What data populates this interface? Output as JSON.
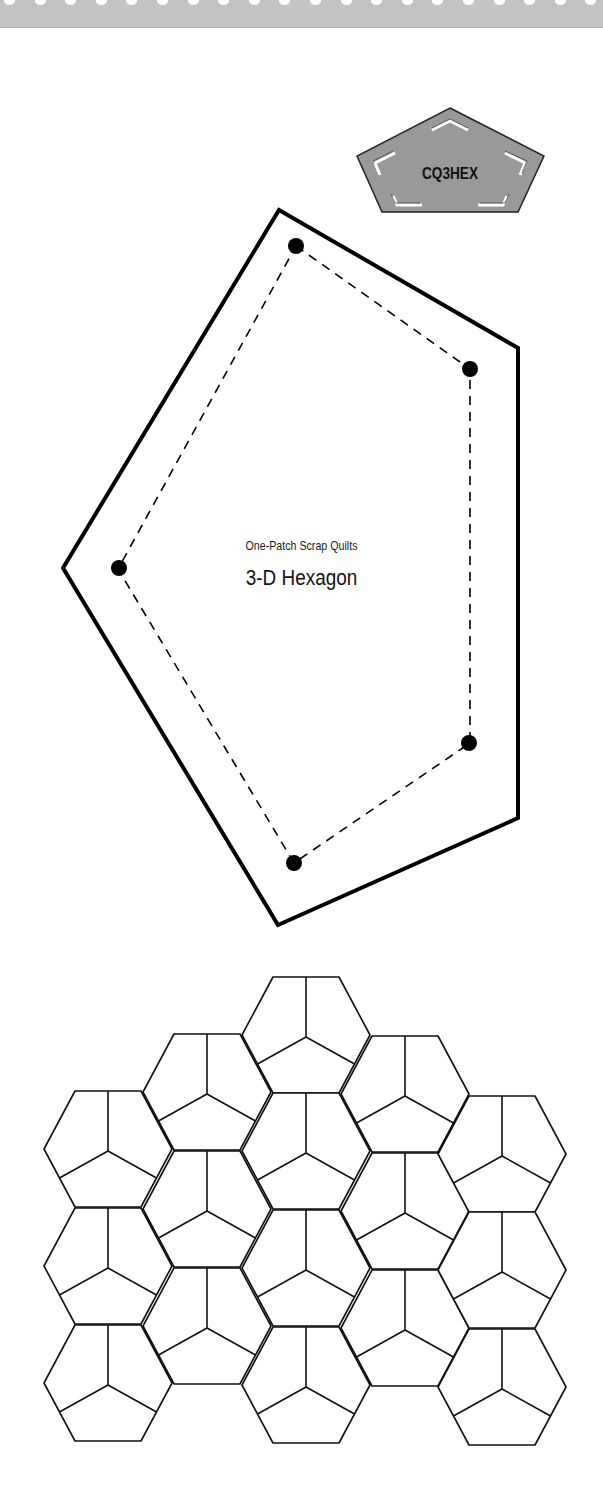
{
  "header": {
    "perforation_count": 20,
    "band_color": "#c4c4c4"
  },
  "badge": {
    "code": "CQ3HEX",
    "fill_color": "#999999"
  },
  "template": {
    "subtitle": "One-Patch Scrap Quilts",
    "title": "3-D Hexagon",
    "outline_color": "#000000",
    "seam_dot_count": 5
  },
  "quilt_layout": {
    "description": "Tessellation of hexagons each divided into three pentagonal patches",
    "columns": [
      {
        "x": 108,
        "centers_y": [
          1149,
          1266,
          1383
        ]
      },
      {
        "x": 207,
        "centers_y": [
          1092,
          1209,
          1326
        ]
      },
      {
        "x": 306,
        "centers_y": [
          1035,
          1151,
          1268,
          1385
        ]
      },
      {
        "x": 405,
        "centers_y": [
          1094,
          1211,
          1328
        ]
      },
      {
        "x": 502,
        "centers_y": [
          1154,
          1270,
          1387
        ]
      }
    ],
    "hex_count": 16
  }
}
